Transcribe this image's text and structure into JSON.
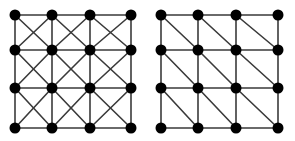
{
  "diagram": {
    "type": "graph-grids",
    "colors": {
      "edge": "#3a3a3a",
      "node": "#000000",
      "background": "#ffffff"
    },
    "node_radius": 5.5,
    "panels": [
      {
        "name": "left-grid-full-diagonals",
        "rows": 4,
        "cols": 4,
        "xs": [
          15,
          52,
          90,
          131
        ],
        "ys": [
          15,
          50,
          88,
          128
        ],
        "diagonals": [
          "backslash",
          "slash"
        ]
      },
      {
        "name": "right-grid-single-diagonals",
        "rows": 4,
        "cols": 4,
        "xs": [
          161,
          198,
          236,
          278
        ],
        "ys": [
          15,
          50,
          88,
          128
        ],
        "diagonals": [
          "backslash"
        ]
      }
    ]
  }
}
